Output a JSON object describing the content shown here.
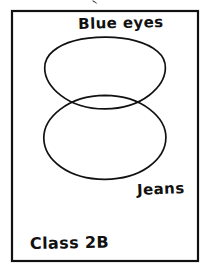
{
  "page": {
    "background_color": "#ffffff",
    "ink_color": "#111111"
  },
  "frame": {
    "name": "worksheet-border",
    "x": 11,
    "y": 10,
    "width": 188,
    "height": 252,
    "stroke_color": "#111111"
  },
  "crop_mark": {
    "present": true,
    "description": "partial ink mark cropped at top edge of image",
    "x": 92,
    "y": 0
  },
  "venn": {
    "type": "two-set-vertical",
    "sets": [
      {
        "id": "blue-eyes",
        "label": "Blue eyes",
        "label_x": 121,
        "label_y": 28,
        "cx": 105,
        "cy": 76,
        "rx": 60,
        "ry": 39
      },
      {
        "id": "jeans",
        "label": "Jeans",
        "label_x": 161,
        "label_y": 194,
        "cx": 105,
        "cy": 137,
        "rx": 60,
        "ry": 42
      }
    ],
    "intersection": {
      "left_point": [
        63,
        108
      ],
      "right_point": [
        150,
        108
      ]
    }
  },
  "caption": {
    "label": "Class 2B",
    "x": 30,
    "y": 249
  }
}
